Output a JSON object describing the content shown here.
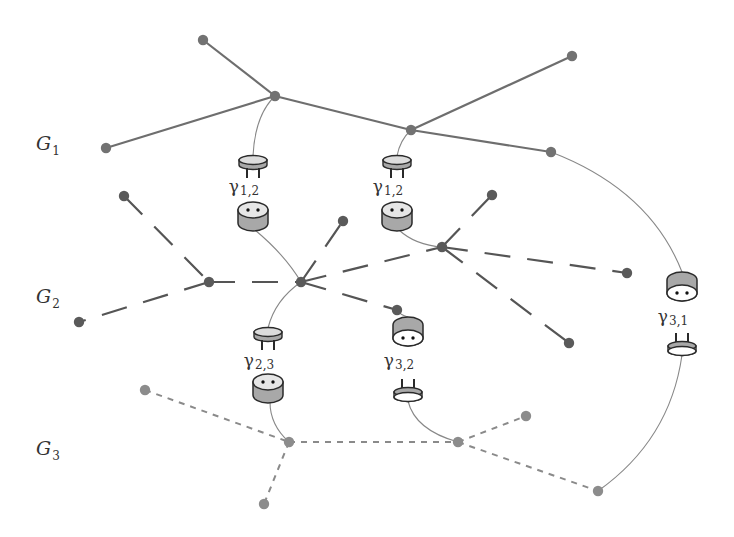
{
  "colors": {
    "g1_edge": "#6e6e6e",
    "g2_edge": "#555555",
    "g3_edge": "#8a8a8a",
    "g1_node": "#727272",
    "g2_node": "#5a5a5a",
    "g3_node": "#8c8c8c",
    "link": "#888888",
    "plug_fill": "#dcdcdc",
    "socket_top": "#e6e6e6",
    "socket_side": "#a8a8a8",
    "outline": "#2a2a2a"
  },
  "graph_labels": [
    {
      "id": "G1",
      "main": "G",
      "sub": "1",
      "x": 36,
      "y": 150
    },
    {
      "id": "G2",
      "main": "G",
      "sub": "2",
      "x": 36,
      "y": 303
    },
    {
      "id": "G3",
      "main": "G",
      "sub": "3",
      "x": 36,
      "y": 455
    }
  ],
  "graphs": [
    {
      "id": "G1",
      "style": "solid",
      "nodes": {
        "a": [
          203,
          40
        ],
        "b": [
          275,
          96
        ],
        "c": [
          106,
          148
        ],
        "d": [
          411,
          130
        ],
        "e": [
          572,
          56
        ],
        "f": [
          551,
          152
        ]
      },
      "edges": [
        [
          "a",
          "b"
        ],
        [
          "b",
          "c"
        ],
        [
          "b",
          "d"
        ],
        [
          "d",
          "e"
        ],
        [
          "d",
          "f"
        ]
      ]
    },
    {
      "id": "G2",
      "style": "longdash",
      "nodes": {
        "g": [
          124,
          196
        ],
        "h": [
          209,
          282
        ],
        "i": [
          301,
          282
        ],
        "j": [
          343,
          221
        ],
        "k": [
          79,
          322
        ],
        "l": [
          442,
          247
        ],
        "m": [
          492,
          195
        ],
        "n": [
          627,
          273
        ],
        "o": [
          569,
          343
        ],
        "p": [
          397,
          310
        ]
      },
      "edges": [
        [
          "g",
          "h"
        ],
        [
          "h",
          "i"
        ],
        [
          "h",
          "k"
        ],
        [
          "i",
          "j"
        ],
        [
          "i",
          "l"
        ],
        [
          "i",
          "p"
        ],
        [
          "l",
          "m"
        ],
        [
          "l",
          "n"
        ],
        [
          "l",
          "o"
        ]
      ]
    },
    {
      "id": "G3",
      "style": "shortdash",
      "nodes": {
        "q": [
          145,
          390
        ],
        "r": [
          289,
          442
        ],
        "s": [
          264,
          504
        ],
        "t": [
          458,
          442
        ],
        "u": [
          526,
          416
        ],
        "v": [
          598,
          491
        ]
      },
      "edges": [
        [
          "q",
          "r"
        ],
        [
          "r",
          "s"
        ],
        [
          "r",
          "t"
        ],
        [
          "t",
          "u"
        ],
        [
          "t",
          "v"
        ]
      ]
    }
  ],
  "connectors": [
    {
      "id": "gamma-1-2-left",
      "label": "γ",
      "sub": "1,2",
      "x": 253,
      "plug_y": 160,
      "label_y": 192,
      "socket_y": 210,
      "order": "plug-top",
      "from": [
        275,
        96
      ],
      "to": [
        301,
        282
      ],
      "from_ctrl": [
        255,
        115
      ],
      "to_ctrl": [
        285,
        255
      ]
    },
    {
      "id": "gamma-1-2-right",
      "label": "γ",
      "sub": "1,2",
      "x": 397,
      "plug_y": 160,
      "label_y": 192,
      "socket_y": 210,
      "order": "plug-top",
      "from": [
        411,
        130
      ],
      "to": [
        442,
        247
      ],
      "from_ctrl": [
        400,
        140
      ],
      "to_ctrl": [
        415,
        245
      ]
    },
    {
      "id": "gamma-2-3",
      "label": "γ",
      "sub": "2,3",
      "x": 268,
      "plug_y": 332,
      "label_y": 366,
      "socket_y": 382,
      "order": "plug-top",
      "from": [
        301,
        282
      ],
      "to": [
        289,
        442
      ],
      "from_ctrl": [
        275,
        300
      ],
      "to_ctrl": [
        270,
        425
      ]
    },
    {
      "id": "gamma-3-2",
      "label": "γ",
      "sub": "3,2",
      "x": 408,
      "plug_y": 392,
      "label_y": 366,
      "socket_y": 325,
      "order": "socket-top",
      "from": [
        397,
        310
      ],
      "to": [
        458,
        442
      ],
      "from_ctrl": [
        400,
        315
      ],
      "to_ctrl": [
        415,
        430
      ]
    },
    {
      "id": "gamma-3-1",
      "label": "γ",
      "sub": "3,1",
      "x": 682,
      "plug_y": 346,
      "label_y": 322,
      "socket_y": 280,
      "order": "socket-top",
      "from": [
        551,
        152
      ],
      "to": [
        598,
        491
      ],
      "from_ctrl": [
        650,
        190
      ],
      "to_ctrl": [
        670,
        440
      ]
    }
  ]
}
